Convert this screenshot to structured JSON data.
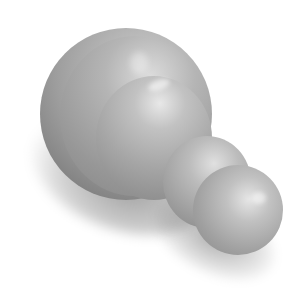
{
  "image": {
    "description": "Grayscale 3D render of rounded dome and sphere shapes",
    "background_color": "#ffffff",
    "tone": "grayscale",
    "objects": [
      {
        "name": "large-dome",
        "color": "#a6a6a6"
      },
      {
        "name": "small-sphere-back",
        "color": "#9c9c9c"
      },
      {
        "name": "small-sphere-front",
        "color": "#a1a1a1"
      }
    ]
  }
}
